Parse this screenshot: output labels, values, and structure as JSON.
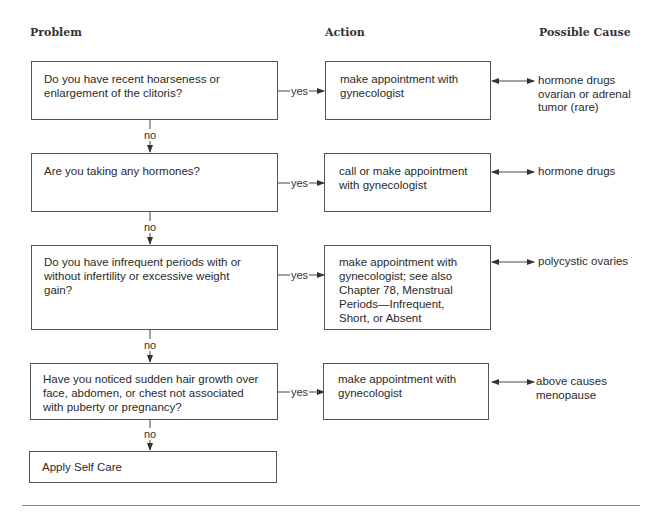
{
  "headers": {
    "problem": "Problem",
    "action": "Action",
    "cause": "Possible Cause"
  },
  "flow": {
    "yes_label": "yes",
    "no_label": "no",
    "steps": [
      {
        "problem": "Do you have recent hoarseness or\nenlargement of the clitoris?",
        "action": "make appointment with\ngynecologist",
        "cause": "hormone drugs\novarian or adrenal\n    tumor (rare)"
      },
      {
        "problem": "Are you taking any hormones?",
        "action": "call or make appointment\nwith gynecologist",
        "cause": "hormone drugs"
      },
      {
        "problem": "Do you have infrequent periods with or\nwithout infertility or excessive weight\ngain?",
        "action": "make appointment with\ngynecologist; see also\nChapter 78, Menstrual\nPeriods—Infrequent,\nShort, or Absent",
        "cause": "polycystic ovaries"
      },
      {
        "problem": "Have you noticed sudden hair growth over\nface, abdomen, or chest not associated\nwith puberty or pregnancy?",
        "action": "make appointment with\ngynecologist",
        "cause": "above causes\nmenopause"
      }
    ],
    "final": "Apply Self Care"
  }
}
